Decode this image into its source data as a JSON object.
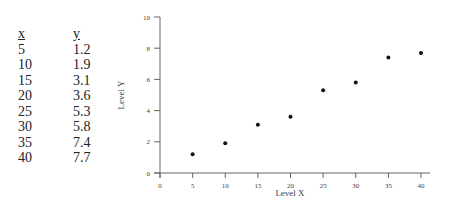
{
  "table": {
    "headers": {
      "x": "x",
      "y": "y"
    },
    "rows": [
      {
        "x": "5",
        "y": "1.2"
      },
      {
        "x": "10",
        "y": "1.9"
      },
      {
        "x": "15",
        "y": "3.1"
      },
      {
        "x": "20",
        "y": "3.6"
      },
      {
        "x": "25",
        "y": "5.3"
      },
      {
        "x": "30",
        "y": "5.8"
      },
      {
        "x": "35",
        "y": "7.4"
      },
      {
        "x": "40",
        "y": "7.7"
      }
    ]
  },
  "chart_data": {
    "type": "scatter",
    "title": "",
    "xlabel": "Level X",
    "ylabel": "Level Y",
    "x": [
      5,
      10,
      15,
      20,
      25,
      30,
      35,
      40
    ],
    "y": [
      1.2,
      1.9,
      3.1,
      3.6,
      5.3,
      5.8,
      7.4,
      7.7
    ],
    "xlim": [
      0,
      40
    ],
    "ylim": [
      0,
      10
    ],
    "xticks": [
      0,
      5,
      10,
      15,
      20,
      25,
      30,
      35,
      40
    ],
    "yticks": [
      0,
      2,
      4,
      6,
      8,
      10
    ],
    "grid": false,
    "legend": null,
    "marker_color": "#111111",
    "axis_color": "#666666"
  }
}
